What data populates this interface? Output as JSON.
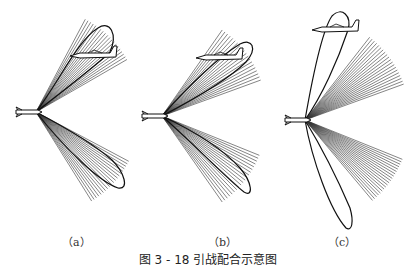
{
  "figure": {
    "caption": "图 3 - 18   引战配合示意图",
    "panels": [
      {
        "id": "a",
        "label": "（a）",
        "apex": [
          36,
          112
        ],
        "upper_fan": {
          "start": -62,
          "end": -30
        },
        "lower_fan": {
          "start": 28,
          "end": 58
        },
        "upper_lobe": "M36,112 C60,80 78,40 98,28 C110,20 118,34 110,52 C100,62 80,78 36,112 Z",
        "lower_lobe": "M36,112 C66,150 100,182 118,188 C130,190 124,172 112,160 C96,146 70,130 36,112 Z",
        "aircraft": [
          96,
          56
        ],
        "label_pos": [
          62,
          233
        ]
      },
      {
        "id": "b",
        "label": "（b）",
        "apex": [
          162,
          116
        ],
        "upper_fan": {
          "start": -55,
          "end": -20
        },
        "lower_fan": {
          "start": 22,
          "end": 55
        },
        "upper_lobe": "M162,116 C190,84 220,56 240,44 C252,38 258,48 246,62 C230,78 200,96 162,116 Z",
        "lower_lobe": "M162,116 C196,146 226,178 244,192 C254,198 252,182 240,168 C222,148 196,132 162,116 Z",
        "aircraft": [
          222,
          58
        ],
        "label_pos": [
          208,
          233
        ]
      },
      {
        "id": "c",
        "label": "（c）",
        "apex": [
          305,
          120
        ],
        "upper_fan": {
          "start": -52,
          "end": -20
        },
        "lower_fan": {
          "start": 22,
          "end": 50
        },
        "upper_lobe": "M305,120 C312,80 322,30 332,16 C342,6 352,16 348,30 C338,60 322,96 305,120 Z",
        "lower_lobe": "M305,120 C312,160 330,210 346,228 C352,232 354,222 350,208 C338,180 322,148 305,120 Z",
        "aircraft": [
          338,
          30
        ],
        "label_pos": [
          328,
          233
        ]
      }
    ]
  }
}
